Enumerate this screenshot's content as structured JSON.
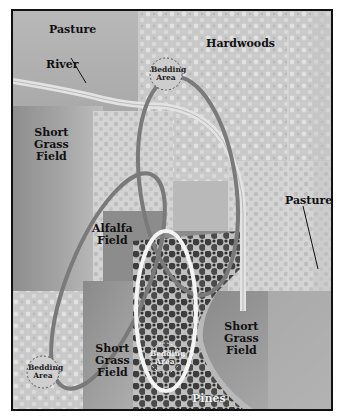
{
  "map": {
    "style": "grayscale hunting-area diagram",
    "colors": {
      "border": "#111111",
      "pasture": "#b5b5b5",
      "short_grass": "#9a9a9a",
      "hardwoods": "#cfcfcf",
      "alfalfa": "#8a8a8a",
      "pines_dark": "#3a3a3a",
      "loop_dark": "#7a7a7a",
      "loop_white": "#f4f4f4",
      "river": "#e0e0e0"
    },
    "regions": [
      {
        "id": "pasture-top-left",
        "label": "Pasture"
      },
      {
        "id": "hardwoods",
        "label": "Hardwoods"
      },
      {
        "id": "river",
        "label": "River"
      },
      {
        "id": "short-grass-left",
        "label_lines": [
          "Short",
          "Grass",
          "Field"
        ]
      },
      {
        "id": "alfalfa",
        "label_lines": [
          "Alfalfa",
          "Field"
        ]
      },
      {
        "id": "pasture-right",
        "label": "Pasture"
      },
      {
        "id": "short-grass-bottom-center",
        "label_lines": [
          "Short",
          "Grass",
          "Field"
        ]
      },
      {
        "id": "short-grass-bottom-right",
        "label_lines": [
          "Short",
          "Grass",
          "Field"
        ]
      },
      {
        "id": "pines",
        "label": "Pines"
      }
    ],
    "bedding_areas": [
      {
        "id": "bedding-top",
        "label_lines": [
          "Bedding",
          "Area"
        ]
      },
      {
        "id": "bedding-bottom-left",
        "label_lines": [
          "Bedding",
          "Area"
        ]
      },
      {
        "id": "bedding-pines",
        "label_lines": [
          "Bedding",
          "Area"
        ]
      }
    ],
    "labels": {
      "pasture_top": "Pasture",
      "hardwoods": "Hardwoods",
      "river": "River",
      "sg_left": [
        "Short",
        "Grass",
        "Field"
      ],
      "alfalfa": [
        "Alfalfa",
        "Field"
      ],
      "pasture_right": "Pasture",
      "sg_bottom_center": [
        "Short",
        "Grass",
        "Field"
      ],
      "sg_bottom_right": [
        "Short",
        "Grass",
        "Field"
      ],
      "pines": "Pines",
      "bedding": [
        "Bedding",
        "Area"
      ]
    }
  }
}
